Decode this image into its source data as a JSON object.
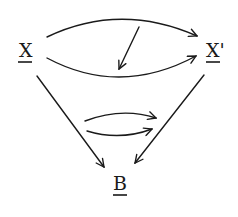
{
  "diagram": {
    "nodes": [
      {
        "id": "X",
        "label": "X",
        "underlined": true
      },
      {
        "id": "Xp",
        "label": "X'",
        "underlined": true
      },
      {
        "id": "B",
        "label": "B",
        "underlined": true
      }
    ],
    "edges": [
      {
        "from": "X",
        "to": "Xp",
        "kind": "upper-curved-arrow"
      },
      {
        "from": "X",
        "to": "Xp",
        "kind": "lower-curved-arrow"
      },
      {
        "kind": "2-cell-arrow",
        "direction": "down-left",
        "between": "upper and lower X→X' arrows"
      },
      {
        "from": "X",
        "to": "B",
        "kind": "straight-arrow"
      },
      {
        "from": "Xp",
        "to": "B",
        "kind": "straight-arrow"
      },
      {
        "kind": "parallel-curved-arrows",
        "count": 2,
        "direction": "right",
        "position": "between X→B and X'→B"
      }
    ],
    "colors": {
      "ink": "#1a1a1a",
      "background": "#ffffff"
    }
  }
}
